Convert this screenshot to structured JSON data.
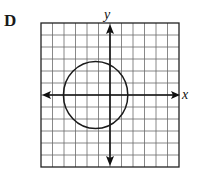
{
  "panel": {
    "label": "D"
  },
  "chart_data": {
    "type": "scatter",
    "title": "",
    "panel_label": "D",
    "xlabel": "x",
    "ylabel": "y",
    "grid": true,
    "grid_columns": 12,
    "grid_rows": 12,
    "xlim": [
      -6,
      6
    ],
    "ylim": [
      -6,
      6
    ],
    "x_ticks_labeled": false,
    "y_ticks_labeled": false,
    "axes": {
      "x_axis_arrows": "both",
      "y_axis_arrows": "both"
    },
    "shapes": [
      {
        "kind": "circle",
        "center": [
          -1.25,
          0
        ],
        "radius": 2.8,
        "description": "Circle left of the y-axis, crossing the x-axis near x=-4 and x=1.5, top near y=3 and bottom near y=-3"
      }
    ],
    "legend": null
  },
  "colors": {
    "grid": "#6b6b6b",
    "axes": "#111111",
    "circle": "#1a1a1a",
    "background": "#ffffff"
  }
}
